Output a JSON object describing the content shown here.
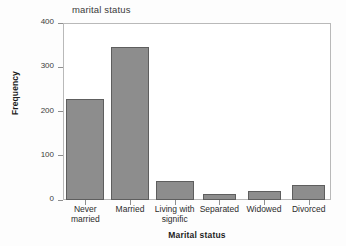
{
  "chart_data": {
    "type": "bar",
    "title": "marital status",
    "xlabel": "Marital status",
    "ylabel": "Frequency",
    "categories": [
      "Never married",
      "Married",
      "Living with signific",
      "Separated",
      "Widowed",
      "Divorced"
    ],
    "category_lines": [
      [
        "Never",
        "married"
      ],
      [
        "Married",
        ""
      ],
      [
        "Living  with",
        "signific"
      ],
      [
        "Separated",
        ""
      ],
      [
        "Widowed",
        ""
      ],
      [
        "Divorced",
        ""
      ]
    ],
    "values": [
      229,
      346,
      43,
      14,
      20,
      35
    ],
    "ylim": [
      0,
      400
    ],
    "yticks": [
      0,
      100,
      200,
      300,
      400
    ],
    "ytick_labels": [
      "0",
      "100",
      "200",
      "300",
      "400"
    ],
    "grid": false,
    "legend": "none",
    "bar_color": "#8d8d8d",
    "bar_edge_color": "#5e5e5e",
    "frame_color": "#b9b9b9",
    "background": "#ffffff"
  }
}
